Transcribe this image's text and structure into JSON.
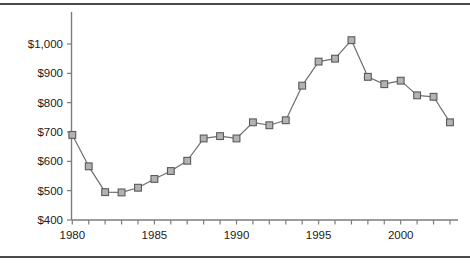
{
  "figure": {
    "background_color": "#ffffff",
    "rule_color": "#4a4a4a",
    "axis_color": "#7d7d7d",
    "line_color": "#6e6e6e",
    "marker_fill_color": "#b3b3b3",
    "marker_edge_color": "#5a5a5a"
  },
  "chart_data": {
    "type": "line",
    "title": "",
    "subtitle": "",
    "xlabel": "",
    "ylabel": "",
    "x": [
      1980,
      1981,
      1982,
      1983,
      1984,
      1985,
      1986,
      1987,
      1988,
      1989,
      1990,
      1991,
      1992,
      1993,
      1994,
      1995,
      1996,
      1997,
      1998,
      1999,
      2000,
      2001,
      2002,
      2003
    ],
    "values": [
      690,
      583,
      495,
      494,
      510,
      540,
      567,
      602,
      678,
      686,
      678,
      733,
      723,
      740,
      858,
      940,
      950,
      1013,
      888,
      863,
      875,
      825,
      820,
      733
    ],
    "series": [
      {
        "name": "",
        "marker": "square",
        "values": [
          690,
          583,
          495,
          494,
          510,
          540,
          567,
          602,
          678,
          686,
          678,
          733,
          723,
          740,
          858,
          940,
          950,
          1013,
          888,
          863,
          875,
          825,
          820,
          733
        ]
      }
    ],
    "xlim": [
      1979.4,
      11.0
    ],
    "ylim": [
      400,
      1050
    ],
    "xtick_values": [
      1980,
      1985,
      1990,
      1995,
      2000
    ],
    "xtick_labels": [
      "1980",
      "1985",
      "1990",
      "1995",
      "2000"
    ],
    "xtick_minor_values": [
      1980,
      1981,
      1982,
      1983,
      1984,
      1985,
      1986,
      1987,
      1988,
      1989,
      1990,
      1991,
      1992,
      1993,
      1994,
      1995,
      1996,
      1997,
      1998,
      1999,
      2000,
      2001,
      2002,
      2003
    ],
    "ytick_values": [
      400,
      500,
      600,
      700,
      800,
      900,
      1000
    ],
    "ytick_labels": [
      "$400",
      "$500",
      "$600",
      "$700",
      "$800",
      "$900",
      "$1,000"
    ],
    "grid": false,
    "legend": null,
    "legend_position": "none",
    "annotations": []
  }
}
